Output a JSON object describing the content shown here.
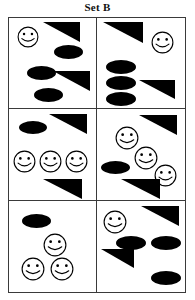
{
  "title": "Set B",
  "colors": {
    "shape_fill": "#000000",
    "border": "#3a3a3a",
    "background": "#ffffff",
    "text": "#111111"
  },
  "puzzle": {
    "label": "Set B",
    "grid": {
      "columns": 2,
      "rows": 3,
      "cell_count": 6
    },
    "shape_legend": {
      "smiley": "smiley-face-icon",
      "ellipse": "filled-ellipse-shape",
      "triangle": "filled-right-triangle-shape"
    },
    "cells": [
      {
        "index": 1,
        "name": "cell-1-top-left",
        "counts": {
          "smiley": 1,
          "ellipse": 3,
          "triangle": 2
        },
        "shapes": [
          {
            "type": "smiley",
            "name": "smiley-face-icon",
            "x": 8,
            "y": 8,
            "w": 22,
            "h": 22
          },
          {
            "type": "triangle",
            "name": "filled-right-triangle-shape",
            "x": 34,
            "y": 4,
            "w": 37,
            "h": 20
          },
          {
            "type": "ellipse",
            "name": "filled-ellipse-shape",
            "x": 45,
            "y": 27,
            "w": 29,
            "h": 14
          },
          {
            "type": "ellipse",
            "name": "filled-ellipse-shape",
            "x": 18,
            "y": 48,
            "w": 29,
            "h": 14
          },
          {
            "type": "triangle",
            "name": "filled-right-triangle-shape",
            "x": 44,
            "y": 53,
            "w": 37,
            "h": 20
          },
          {
            "type": "ellipse",
            "name": "filled-ellipse-shape",
            "x": 25,
            "y": 70,
            "w": 29,
            "h": 14
          }
        ]
      },
      {
        "index": 2,
        "name": "cell-2-top-right",
        "counts": {
          "smiley": 1,
          "ellipse": 3,
          "triangle": 2
        },
        "shapes": [
          {
            "type": "triangle",
            "name": "filled-right-triangle-shape",
            "x": 6,
            "y": 4,
            "w": 40,
            "h": 21
          },
          {
            "type": "smiley",
            "name": "smiley-face-icon",
            "x": 54,
            "y": 13,
            "w": 23,
            "h": 23
          },
          {
            "type": "ellipse",
            "name": "filled-ellipse-shape",
            "x": 9,
            "y": 42,
            "w": 30,
            "h": 14
          },
          {
            "type": "ellipse",
            "name": "filled-ellipse-shape",
            "x": 9,
            "y": 58,
            "w": 30,
            "h": 14
          },
          {
            "type": "triangle",
            "name": "filled-right-triangle-shape",
            "x": 42,
            "y": 62,
            "w": 36,
            "h": 19
          },
          {
            "type": "ellipse",
            "name": "filled-ellipse-shape",
            "x": 9,
            "y": 74,
            "w": 30,
            "h": 14
          }
        ]
      },
      {
        "index": 3,
        "name": "cell-3-middle-left",
        "counts": {
          "smiley": 3,
          "ellipse": 1,
          "triangle": 2
        },
        "shapes": [
          {
            "type": "ellipse",
            "name": "filled-ellipse-shape",
            "x": 10,
            "y": 12,
            "w": 28,
            "h": 13
          },
          {
            "type": "triangle",
            "name": "filled-right-triangle-shape",
            "x": 40,
            "y": 5,
            "w": 38,
            "h": 20
          },
          {
            "type": "smiley",
            "name": "smiley-face-icon",
            "x": 4,
            "y": 41,
            "w": 23,
            "h": 23
          },
          {
            "type": "smiley",
            "name": "smiley-face-icon",
            "x": 30,
            "y": 41,
            "w": 23,
            "h": 23
          },
          {
            "type": "smiley",
            "name": "smiley-face-icon",
            "x": 56,
            "y": 41,
            "w": 23,
            "h": 23
          },
          {
            "type": "triangle",
            "name": "filled-right-triangle-shape",
            "x": 34,
            "y": 70,
            "w": 39,
            "h": 20
          }
        ]
      },
      {
        "index": 4,
        "name": "cell-4-middle-right",
        "counts": {
          "smiley": 3,
          "ellipse": 1,
          "triangle": 2
        },
        "shapes": [
          {
            "type": "triangle",
            "name": "filled-right-triangle-shape",
            "x": 42,
            "y": 6,
            "w": 38,
            "h": 20
          },
          {
            "type": "smiley",
            "name": "smiley-face-icon",
            "x": 18,
            "y": 17,
            "w": 24,
            "h": 24
          },
          {
            "type": "smiley",
            "name": "smiley-face-icon",
            "x": 37,
            "y": 37,
            "w": 24,
            "h": 24
          },
          {
            "type": "ellipse",
            "name": "filled-ellipse-shape",
            "x": 4,
            "y": 52,
            "w": 29,
            "h": 13
          },
          {
            "type": "smiley",
            "name": "smiley-face-icon",
            "x": 57,
            "y": 55,
            "w": 23,
            "h": 23
          },
          {
            "type": "triangle",
            "name": "filled-right-triangle-shape",
            "x": 24,
            "y": 70,
            "w": 39,
            "h": 20
          }
        ]
      },
      {
        "index": 5,
        "name": "cell-5-bottom-left",
        "counts": {
          "smiley": 3,
          "ellipse": 1,
          "triangle": 0
        },
        "shapes": [
          {
            "type": "ellipse",
            "name": "filled-ellipse-shape",
            "x": 13,
            "y": 13,
            "w": 29,
            "h": 14
          },
          {
            "type": "smiley",
            "name": "smiley-face-icon",
            "x": 34,
            "y": 32,
            "w": 24,
            "h": 24
          },
          {
            "type": "smiley",
            "name": "smiley-face-icon",
            "x": 12,
            "y": 56,
            "w": 24,
            "h": 24
          },
          {
            "type": "smiley",
            "name": "smiley-face-icon",
            "x": 41,
            "y": 56,
            "w": 24,
            "h": 24
          }
        ]
      },
      {
        "index": 6,
        "name": "cell-6-bottom-right",
        "counts": {
          "smiley": 1,
          "ellipse": 3,
          "triangle": 2
        },
        "shapes": [
          {
            "type": "smiley",
            "name": "smiley-face-icon",
            "x": 6,
            "y": 9,
            "w": 24,
            "h": 24
          },
          {
            "type": "triangle",
            "name": "filled-right-triangle-shape",
            "x": 44,
            "y": 5,
            "w": 38,
            "h": 20
          },
          {
            "type": "ellipse",
            "name": "filled-ellipse-shape",
            "x": 19,
            "y": 35,
            "w": 30,
            "h": 14
          },
          {
            "type": "ellipse",
            "name": "filled-ellipse-shape",
            "x": 54,
            "y": 35,
            "w": 30,
            "h": 14
          },
          {
            "type": "triangle",
            "name": "filled-right-triangle-shape",
            "x": 4,
            "y": 48,
            "w": 33,
            "h": 19
          },
          {
            "type": "ellipse",
            "name": "filled-ellipse-shape",
            "x": 54,
            "y": 70,
            "w": 30,
            "h": 14
          }
        ]
      }
    ]
  }
}
